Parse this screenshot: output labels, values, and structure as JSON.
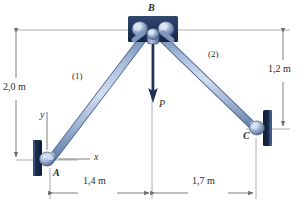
{
  "figure": {
    "type": "two-bar-truss-free-body-diagram",
    "background": "#ffffff"
  },
  "colors": {
    "member_light": "#b9c9e2",
    "member_mid": "#8fa8ca",
    "member_edge": "#5f7fae",
    "plate_dark": "#1b2c4b",
    "plate_mid": "#2e4470",
    "pin_light": "#c3d2e6",
    "pin_mid": "#7f99bd",
    "gusset": "#25395e",
    "force_arrow": "#1f3155",
    "dim_line": "#7a7a7a",
    "text": "#2b2b2b"
  },
  "joints": {
    "A": {
      "label": "A",
      "x": 50,
      "y": 160
    },
    "B": {
      "label": "B",
      "x": 152,
      "y": 30
    },
    "C": {
      "label": "C",
      "x": 256,
      "y": 129
    }
  },
  "members": [
    {
      "label": "(1)",
      "from": "A",
      "to": "B",
      "label_x": 72,
      "label_y": 72
    },
    {
      "label": "(2)",
      "from": "B",
      "to": "C",
      "label_x": 208,
      "label_y": 50
    }
  ],
  "load": {
    "label": "P",
    "direction": "down",
    "label_x": 162,
    "label_y": 103
  },
  "axes": {
    "x_label": "x",
    "y_label": "y",
    "origin": "A",
    "x_label_x": 93,
    "x_label_y": 156,
    "y_label_x": 40,
    "y_label_y": 113
  },
  "dimensions": [
    {
      "name": "vertical-left",
      "value": "2,0 m",
      "label_x": 7,
      "label_y": 88,
      "orientation": "vertical"
    },
    {
      "name": "vertical-right",
      "value": "1,2 m",
      "label_x": 262,
      "label_y": 70,
      "orientation": "vertical"
    },
    {
      "name": "horizontal-left",
      "value": "1,4 m",
      "label_x": 85,
      "label_y": 182,
      "orientation": "horizontal"
    },
    {
      "name": "horizontal-right",
      "value": "1,7 m",
      "label_x": 196,
      "label_y": 182,
      "orientation": "horizontal"
    }
  ],
  "supports": [
    {
      "name": "support-A",
      "joint": "A",
      "wall_side": "left"
    },
    {
      "name": "support-C",
      "joint": "C",
      "wall_side": "right"
    }
  ]
}
